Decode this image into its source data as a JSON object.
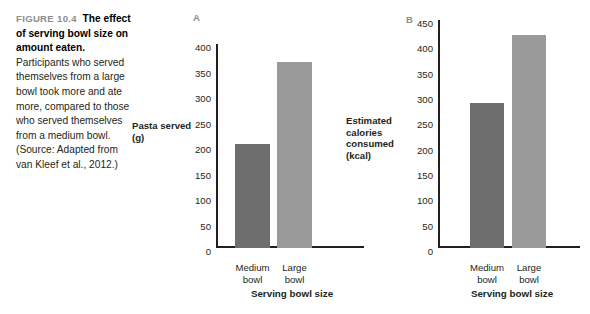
{
  "caption": {
    "figure_number": "FIGURE 10.4",
    "title": "The effect of serving bowl size on amount eaten.",
    "body": "Participants who served themselves from a large bowl took more and ate more, compared to those who served themselves from a medium bowl. (Source: Adapted from van Kleef et al., 2012.)"
  },
  "colors": {
    "bar_dark": "#6e6e6e",
    "bar_light": "#9a9a9a",
    "figure_number": "#8d8d8d",
    "text": "#231f20",
    "background": "#ffffff"
  },
  "panels": [
    {
      "letter": "A"
    },
    {
      "letter": "B"
    }
  ],
  "chart_data": [
    {
      "type": "bar",
      "panel": "A",
      "title": "",
      "categories": [
        "Medium\nbowl",
        "Large\nbowl"
      ],
      "values": [
        204,
        364
      ],
      "xlabel": "Serving bowl size",
      "ylabel": "Pasta served (g)",
      "ylim": [
        0,
        400
      ],
      "yticks": [
        0,
        50,
        100,
        150,
        200,
        250,
        300,
        350,
        400
      ],
      "ytick_labels": [
        "0",
        "50",
        "100",
        "150",
        "200",
        "250",
        "300",
        "350",
        "400"
      ],
      "grid": false,
      "legend": "none",
      "bar_colors": [
        "#6e6e6e",
        "#9a9a9a"
      ]
    },
    {
      "type": "bar",
      "panel": "B",
      "title": "",
      "categories": [
        "Medium\nbowl",
        "Large\nbowl"
      ],
      "values": [
        286,
        420
      ],
      "xlabel": "Serving bowl size",
      "ylabel": "Estimated calories consumed (kcal)",
      "ylim": [
        0,
        450
      ],
      "yticks": [
        0,
        50,
        100,
        150,
        200,
        250,
        300,
        350,
        400,
        450
      ],
      "ytick_labels": [
        "0",
        "50",
        "100",
        "150",
        "200",
        "250",
        "300",
        "350",
        "400",
        "450"
      ],
      "grid": false,
      "legend": "none",
      "bar_colors": [
        "#6e6e6e",
        "#9a9a9a"
      ]
    }
  ]
}
